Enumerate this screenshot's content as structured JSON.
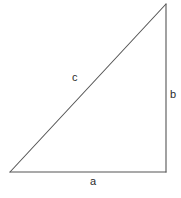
{
  "figure": {
    "kind": "right-triangle-diagram",
    "width": 181,
    "height": 198,
    "background_color": "#ffffff",
    "stroke_color": "#555555",
    "stroke_width": 1,
    "text_color": "#2b2b2b",
    "vertices": {
      "apex": {
        "x": 166,
        "y": 4
      },
      "right_angle": {
        "x": 166,
        "y": 172
      },
      "left": {
        "x": 10,
        "y": 172
      }
    },
    "sides": [
      {
        "id": "a",
        "label": "a",
        "role": "base",
        "from": "left",
        "to": "right_angle",
        "label_x": 93,
        "label_y": 182
      },
      {
        "id": "b",
        "label": "b",
        "role": "vertical-leg",
        "from": "right_angle",
        "to": "apex",
        "label_x": 173,
        "label_y": 95
      },
      {
        "id": "c",
        "label": "c",
        "role": "hypotenuse",
        "from": "left",
        "to": "apex",
        "label_x": 75,
        "label_y": 78
      }
    ]
  }
}
